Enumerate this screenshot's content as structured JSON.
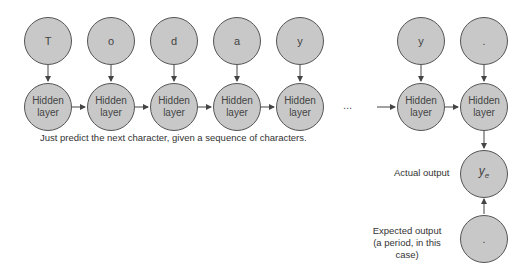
{
  "diagram": {
    "input_characters": [
      "T",
      "o",
      "d",
      "a",
      "y",
      "y",
      "."
    ],
    "hidden_label_line1": "Hidden",
    "hidden_label_line2": "layer",
    "ellipsis": "...",
    "caption": "Just predict the next character, given a sequence of characters.",
    "actual_output": {
      "label": "Actual output",
      "symbol": "y",
      "subscript": "e"
    },
    "expected_output": {
      "label_line1": "Expected output",
      "label_line2": "(a period, in this case)",
      "symbol": "."
    },
    "colors": {
      "node_fill": "#c8c8c8",
      "node_stroke": "#555555",
      "arrow": "#444444"
    }
  }
}
